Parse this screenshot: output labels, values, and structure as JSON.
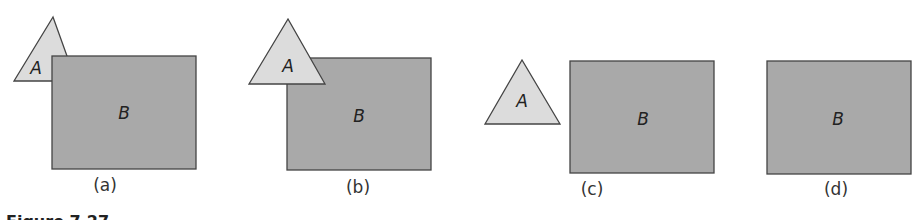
{
  "colors": {
    "rect_fill": "#a9a9a9",
    "triangle_fill": "#dcdcdc",
    "stroke": "#444444"
  },
  "panels": [
    {
      "caption": "(a)",
      "triangle": {
        "label": "A",
        "points": "53,17 14,81 76,81",
        "label_x": 36,
        "label_y": 68
      },
      "rect": {
        "label": "B",
        "x": 52,
        "y": 56,
        "w": 144,
        "h": 113
      },
      "caption_x": 105,
      "caption_y": 176
    },
    {
      "caption": "(b)",
      "triangle": {
        "label": "A",
        "points": "288,19 249,84 325,84",
        "label_x": 287,
        "label_y": 68
      },
      "rect": {
        "label": "B",
        "x": 287,
        "y": 58,
        "w": 144,
        "h": 112
      },
      "caption_x": 358,
      "caption_y": 178
    },
    {
      "caption": "(c)",
      "triangle": {
        "label": "A",
        "points": "522,60 485,124 560,124",
        "label_x": 522,
        "label_y": 109
      },
      "rect": {
        "label": "B",
        "x": 570,
        "y": 61,
        "w": 144,
        "h": 112
      },
      "caption_x": 592,
      "caption_y": 180
    },
    {
      "caption": "(d)",
      "triangle": null,
      "rect": {
        "label": "B",
        "x": 767,
        "y": 61,
        "w": 144,
        "h": 113
      },
      "caption_x": 836,
      "caption_y": 180
    }
  ],
  "figure_caption": "Figure 7.27"
}
